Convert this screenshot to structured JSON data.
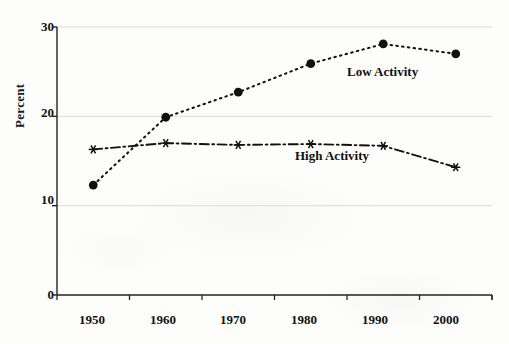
{
  "chart_data": {
    "type": "line",
    "title": "",
    "subtitle": "",
    "xlabel": "",
    "ylabel": "Percent",
    "x": [
      1950,
      1960,
      1970,
      1980,
      1990,
      2000
    ],
    "categories": [
      "1950",
      "1960",
      "1970",
      "1980",
      "1990",
      "2000"
    ],
    "series": [
      {
        "name": "Low Activity",
        "values": [
          12.3,
          19.9,
          22.7,
          25.9,
          28.1,
          27.0
        ],
        "marker": "filled-circle",
        "linestyle": "dotted",
        "color": "#111111"
      },
      {
        "name": "High Activity",
        "values": [
          16.3,
          17.0,
          16.8,
          16.9,
          16.7,
          14.3
        ],
        "marker": "asterisk",
        "linestyle": "dash-dot",
        "color": "#111111"
      }
    ],
    "ylim": [
      0,
      30
    ],
    "xlim": [
      1945,
      2005
    ],
    "yticks": [
      0,
      10,
      20,
      30
    ],
    "ytick_labels": [
      "0",
      "10",
      "20",
      "30"
    ],
    "xtick_labels": [
      "1950",
      "1960",
      "1970",
      "1980",
      "1990",
      "2000"
    ],
    "grid": "horizontal-light",
    "legend_position": "inline-annotations",
    "annotations": [
      {
        "text": "Low Activity",
        "x_px": 347,
        "y_px": 72
      },
      {
        "text": "High Activity",
        "x_px": 295,
        "y_px": 156
      }
    ]
  },
  "axis": {
    "y_label": "Percent",
    "y_ticks": [
      "30",
      "20",
      "10",
      "0"
    ],
    "x_ticks": [
      "1950",
      "1960",
      "1970",
      "1980",
      "1990",
      "2000"
    ]
  },
  "legend": {
    "low_activity": "Low Activity",
    "high_activity": "High Activity"
  },
  "colors": {
    "series_ink": "#111111",
    "grid": "#dddad6",
    "axis": "#222222",
    "background": "#fdfdfc"
  }
}
